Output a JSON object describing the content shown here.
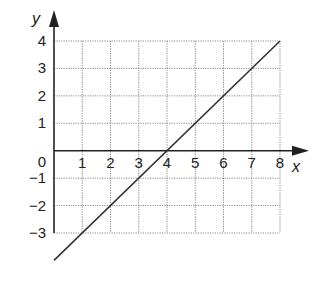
{
  "chart_data": {
    "type": "line",
    "title": "",
    "xlabel": "x",
    "ylabel": "y",
    "xlim": [
      0,
      8
    ],
    "ylim": [
      -3,
      4
    ],
    "grid": true,
    "grid_style": "dotted",
    "x_ticks": [
      0,
      1,
      2,
      3,
      4,
      5,
      6,
      7,
      8
    ],
    "y_ticks": [
      -3,
      -2,
      -1,
      0,
      1,
      2,
      3,
      4
    ],
    "x_tick_labels": [
      "1",
      "2",
      "3",
      "4",
      "5",
      "6",
      "7",
      "8"
    ],
    "y_tick_labels": [
      "4",
      "3",
      "2",
      "1",
      "0",
      "−1",
      "−2",
      "−3"
    ],
    "series": [
      {
        "name": "line",
        "equation": "y = x - 4",
        "x": [
          0,
          1,
          2,
          3,
          4,
          5,
          6,
          7,
          8
        ],
        "y": [
          -4,
          -3,
          -2,
          -1,
          0,
          1,
          2,
          3,
          4
        ]
      }
    ],
    "legend": null
  },
  "labels": {
    "x_axis": "x",
    "y_axis": "y"
  },
  "colors": {
    "line": "#333333",
    "grid": "#888888",
    "axis": "#222222"
  }
}
